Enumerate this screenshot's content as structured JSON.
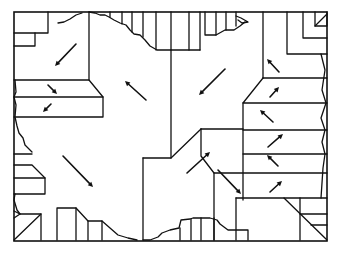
{
  "figure": {
    "type": "region-partition diagram with direction arrows",
    "stroke_color": "#111111",
    "background_color": "#ffffff",
    "regions": [
      {
        "name": "upper-left-region",
        "arrow_direction": "down-left"
      },
      {
        "name": "left-step-upper",
        "arrow_direction": "down-right"
      },
      {
        "name": "left-step-lower",
        "arrow_direction": "down-left"
      },
      {
        "name": "central-region",
        "arrow_direction": "up-left"
      },
      {
        "name": "upper-center-right-region",
        "arrow_direction": "down-left"
      },
      {
        "name": "lower-left-region",
        "arrow_direction": "down-right"
      },
      {
        "name": "lower-center-step",
        "arrow_direction": "up-right"
      },
      {
        "name": "lower-center-right",
        "arrow_direction": "down-right"
      },
      {
        "name": "right-band-1",
        "arrow_direction": "up-left"
      },
      {
        "name": "right-band-2",
        "arrow_direction": "up-right"
      },
      {
        "name": "right-band-3",
        "arrow_direction": "up-left"
      },
      {
        "name": "right-band-4",
        "arrow_direction": "up-right"
      },
      {
        "name": "right-band-5",
        "arrow_direction": "up-left"
      },
      {
        "name": "right-band-6",
        "arrow_direction": "up-right"
      }
    ]
  }
}
